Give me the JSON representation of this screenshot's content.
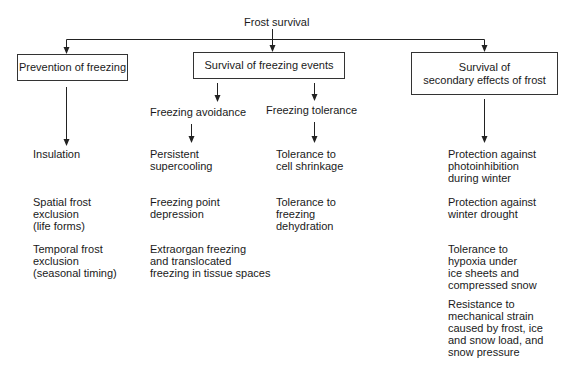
{
  "diagram": {
    "root": {
      "label": "Frost survival"
    },
    "branches": [
      {
        "label": "Prevention of freezing",
        "items": [
          "Insulation",
          "Spatial frost\nexclusion\n(life forms)",
          "Temporal frost\nexclusion\n(seasonal timing)"
        ]
      },
      {
        "label": "Survival of freezing events",
        "sub_branches": [
          {
            "label": "Freezing avoidance",
            "items": [
              "Persistent\nsupercooling",
              "Freezing point\ndepression",
              "Extraorgan freezing\nand translocated\nfreezing in tissue spaces"
            ]
          },
          {
            "label": "Freezing tolerance",
            "items": [
              "Tolerance to\ncell shrinkage",
              "Tolerance to\nfreezing\ndehydration"
            ]
          }
        ]
      },
      {
        "label": "Survival of\nsecondary effects of frost",
        "items": [
          "Protection against\nphotoinhibition\nduring winter",
          "Protection against\nwinter drought",
          "Tolerance to\nhypoxia under\nice sheets and\ncompressed snow",
          "Resistance to\nmechanical strain\ncaused by frost, ice\nand snow load, and\nsnow pressure"
        ]
      }
    ],
    "colors": {
      "line": "#222222",
      "text": "#1a1a1a",
      "background": "#ffffff"
    }
  }
}
